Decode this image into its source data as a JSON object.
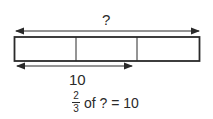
{
  "diagram": {
    "type": "tape-diagram",
    "total_label": "?",
    "segments": 3,
    "part_label": "10",
    "part_segments_covered": 2,
    "equation": {
      "numerator": "2",
      "denominator": "3",
      "text": "of ? = 10"
    },
    "colors": {
      "stroke": "#2a2a2a",
      "background": "#ffffff"
    }
  }
}
